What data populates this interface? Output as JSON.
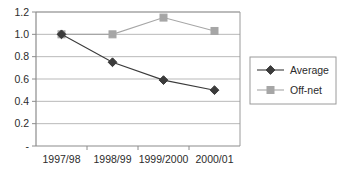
{
  "chart_data": {
    "type": "line",
    "title": "",
    "subtitle": "",
    "xlabel": "",
    "ylabel": "",
    "categories": [
      "1997/98",
      "1998/99",
      "1999/2000",
      "2000/01"
    ],
    "series": [
      {
        "name": "Average",
        "values": [
          1.0,
          0.75,
          0.59,
          0.5
        ],
        "color": "#3b3b3b",
        "marker": "diamond"
      },
      {
        "name": "Off-net",
        "values": [
          1.0,
          1.0,
          1.15,
          1.03
        ],
        "color": "#a6a6a6",
        "marker": "square"
      }
    ],
    "ylim": [
      0,
      1.2
    ],
    "ytick_values": [
      0,
      0.2,
      0.4,
      0.6,
      0.8,
      1.0,
      1.2
    ],
    "ytick_labels": [
      "-",
      "0.2",
      "0.4",
      "0.6",
      "0.8",
      "1.0",
      "1.2"
    ],
    "grid": true,
    "grid_axis": "y",
    "grid_color": "#b9b9b9",
    "legend_position": "right",
    "legend_entries": [
      "Average",
      "Off-net"
    ],
    "plot_background": "#ffffff",
    "axis_color": "#8c8c8c"
  }
}
